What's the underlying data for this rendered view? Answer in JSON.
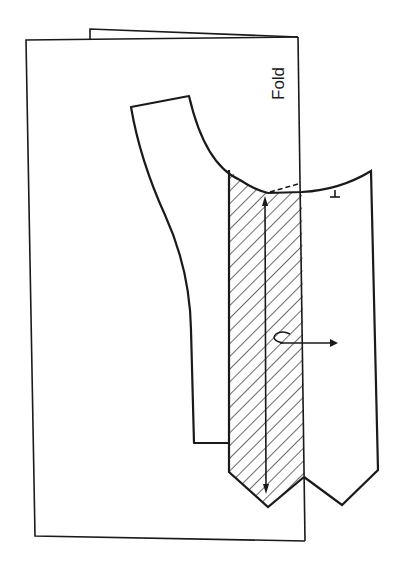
{
  "diagram": {
    "type": "pattern-layout-on-folded-fabric",
    "labels": {
      "fold": "Fold"
    },
    "colors": {
      "stroke": "#1a1a1a",
      "background": "#ffffff",
      "hatch": "#1a1a1a"
    },
    "elements": [
      {
        "name": "folded-fabric-back-layer",
        "description": "paper/fabric back layer peeking above top edge"
      },
      {
        "name": "folded-fabric-front",
        "description": "rectangular folded fabric with fold line on right"
      },
      {
        "name": "pattern-piece-bodice",
        "description": "curved pattern piece with armhole curve"
      },
      {
        "name": "hatched-facing-strip",
        "description": "diagonally hatched strip along fold"
      },
      {
        "name": "right-pattern-extension",
        "description": "pattern piece extending beyond fold with pointed bottom"
      },
      {
        "name": "grainline-arrow",
        "description": "double-headed vertical arrow"
      },
      {
        "name": "place-on-fold-arrow",
        "description": "hooked horizontal arrow pointing right"
      },
      {
        "name": "notch-mark",
        "description": "small T-shaped notch on neckline curve"
      },
      {
        "name": "dashed-seam-line",
        "description": "short dashed line at top of hatched strip"
      }
    ]
  }
}
